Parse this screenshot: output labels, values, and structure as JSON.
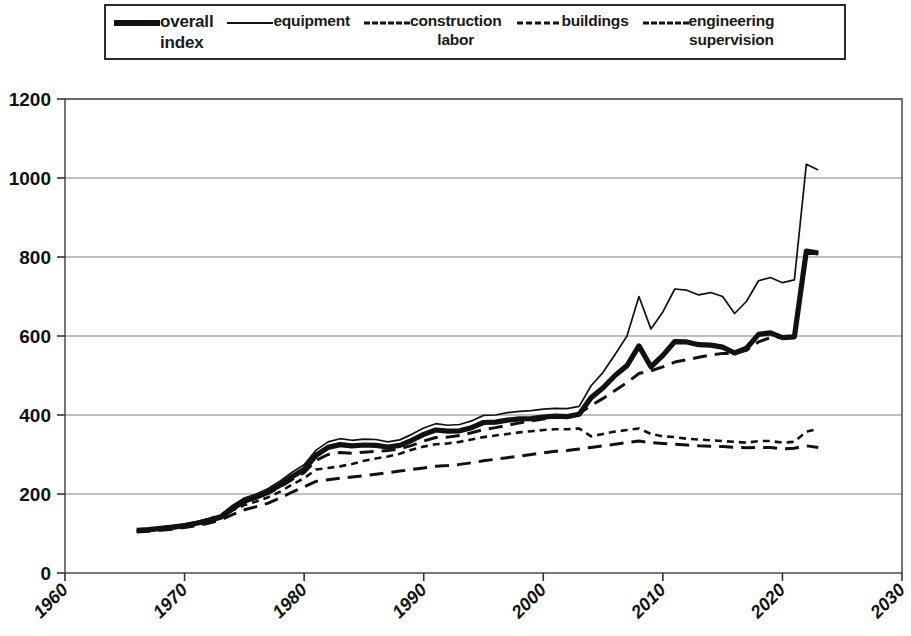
{
  "legend": {
    "entries": [
      {
        "label": "overall\nindex",
        "style": "thick-solid",
        "icon": "line-thick-icon"
      },
      {
        "label": "equipment",
        "style": "thin-solid",
        "icon": "line-thin-icon"
      },
      {
        "label": "construction\nlabor",
        "style": "long-dash",
        "icon": "line-longdash-icon"
      },
      {
        "label": "buildings",
        "style": "short-dash",
        "icon": "line-shortdash-icon"
      },
      {
        "label": "engineering\nsupervision",
        "style": "long-dash",
        "icon": "line-longdash2-icon"
      }
    ]
  },
  "axes": {
    "y_ticks": [
      "0",
      "200",
      "400",
      "600",
      "800",
      "1000",
      "1200"
    ],
    "x_ticks": [
      "1960",
      "1970",
      "1980",
      "1990",
      "2000",
      "2010",
      "2020",
      "2030"
    ]
  },
  "colors": {
    "line": "#111111",
    "grid": "#808080",
    "frame": "#555555",
    "background": "#ffffff"
  },
  "chart_data": {
    "type": "line",
    "title": "",
    "xlabel": "",
    "ylabel": "",
    "xlim": [
      1960,
      2030
    ],
    "ylim": [
      0,
      1200
    ],
    "ytick_step": 200,
    "xtick_step": 10,
    "grid": true,
    "legend_position": "top",
    "series": [
      {
        "name": "overall index",
        "style": "thick-solid",
        "x": [
          1966,
          1967,
          1968,
          1969,
          1970,
          1971,
          1972,
          1973,
          1974,
          1975,
          1976,
          1977,
          1978,
          1979,
          1980,
          1981,
          1982,
          1983,
          1984,
          1985,
          1986,
          1987,
          1988,
          1989,
          1990,
          1991,
          1992,
          1993,
          1994,
          1995,
          1996,
          1997,
          1998,
          1999,
          2000,
          2001,
          2002,
          2003,
          2004,
          2005,
          2006,
          2007,
          2008,
          2009,
          2010,
          2011,
          2012,
          2013,
          2014,
          2015,
          2016,
          2017,
          2018,
          2019,
          2020,
          2021,
          2022,
          2023
        ],
        "values": [
          108,
          110,
          113,
          116,
          120,
          126,
          132,
          141,
          163,
          182,
          192,
          205,
          223,
          244,
          262,
          298,
          318,
          325,
          322,
          324,
          323,
          319,
          323,
          336,
          351,
          362,
          359,
          360,
          368,
          381,
          382,
          387,
          390,
          391,
          395,
          397,
          396,
          402,
          444,
          469,
          500,
          525,
          575,
          522,
          551,
          586,
          585,
          578,
          577,
          572,
          557,
          569,
          604,
          608,
          596,
          598,
          815,
          810
        ]
      },
      {
        "name": "equipment",
        "style": "thin-solid",
        "x": [
          1966,
          1967,
          1968,
          1969,
          1970,
          1971,
          1972,
          1973,
          1974,
          1975,
          1976,
          1977,
          1978,
          1979,
          1980,
          1981,
          1982,
          1983,
          1984,
          1985,
          1986,
          1987,
          1988,
          1989,
          1990,
          1991,
          1992,
          1993,
          1994,
          1995,
          1996,
          1997,
          1998,
          1999,
          2000,
          2001,
          2002,
          2003,
          2004,
          2005,
          2006,
          2007,
          2008,
          2009,
          2010,
          2011,
          2012,
          2013,
          2014,
          2015,
          2016,
          2017,
          2018,
          2019,
          2020,
          2021,
          2022,
          2023
        ],
        "values": [
          110,
          112,
          116,
          120,
          124,
          130,
          137,
          147,
          171,
          190,
          200,
          214,
          233,
          255,
          274,
          311,
          332,
          340,
          336,
          339,
          338,
          332,
          337,
          351,
          367,
          378,
          374,
          376,
          385,
          399,
          400,
          406,
          409,
          411,
          415,
          417,
          416,
          422,
          474,
          508,
          553,
          600,
          700,
          618,
          661,
          719,
          716,
          704,
          710,
          700,
          657,
          688,
          740,
          748,
          735,
          742,
          1035,
          1020
        ]
      },
      {
        "name": "construction labor",
        "style": "long-dash",
        "x": [
          1966,
          1967,
          1968,
          1969,
          1970,
          1971,
          1972,
          1973,
          1974,
          1975,
          1976,
          1977,
          1978,
          1979,
          1980,
          1981,
          1982,
          1983,
          1984,
          1985,
          1986,
          1987,
          1988,
          1989,
          1990,
          1991,
          1992,
          1993,
          1994,
          1995,
          1996,
          1997,
          1998,
          1999,
          2000,
          2001,
          2002,
          2003,
          2004,
          2005,
          2006,
          2007,
          2008,
          2009,
          2010,
          2011,
          2012,
          2013,
          2014,
          2015,
          2016,
          2017,
          2018,
          2019,
          2020,
          2021,
          2022,
          2023
        ],
        "values": [
          106,
          109,
          112,
          116,
          121,
          128,
          136,
          146,
          164,
          180,
          190,
          202,
          218,
          237,
          254,
          285,
          300,
          305,
          303,
          306,
          308,
          310,
          314,
          323,
          334,
          343,
          344,
          348,
          355,
          363,
          368,
          374,
          380,
          385,
          390,
          395,
          398,
          404,
          424,
          442,
          462,
          482,
          505,
          512,
          522,
          534,
          540,
          546,
          552,
          556,
          556,
          564,
          585,
          596,
          598,
          600,
          812,
          808
        ]
      },
      {
        "name": "buildings",
        "style": "short-dash",
        "x": [
          1966,
          1967,
          1968,
          1969,
          1970,
          1971,
          1972,
          1973,
          1974,
          1975,
          1976,
          1977,
          1978,
          1979,
          1980,
          1981,
          1982,
          1983,
          1984,
          1985,
          1986,
          1987,
          1988,
          1989,
          1990,
          1991,
          1992,
          1993,
          1994,
          1995,
          1996,
          1997,
          1998,
          1999,
          2000,
          2001,
          2002,
          2003,
          2004,
          2005,
          2006,
          2007,
          2008,
          2009,
          2010,
          2011,
          2012,
          2013,
          2014,
          2015,
          2016,
          2017,
          2018,
          2019,
          2020,
          2021,
          2022,
          2023
        ],
        "values": [
          105,
          107,
          110,
          113,
          118,
          124,
          132,
          142,
          158,
          172,
          181,
          192,
          206,
          224,
          240,
          262,
          266,
          270,
          276,
          284,
          290,
          295,
          302,
          312,
          320,
          326,
          328,
          332,
          338,
          344,
          348,
          352,
          356,
          359,
          362,
          364,
          364,
          366,
          346,
          352,
          358,
          362,
          366,
          352,
          346,
          344,
          340,
          338,
          336,
          334,
          332,
          330,
          334,
          334,
          330,
          332,
          358,
          365
        ]
      },
      {
        "name": "engineering supervision",
        "style": "long-dash",
        "x": [
          1966,
          1967,
          1968,
          1969,
          1970,
          1971,
          1972,
          1973,
          1974,
          1975,
          1976,
          1977,
          1978,
          1979,
          1980,
          1981,
          1982,
          1983,
          1984,
          1985,
          1986,
          1987,
          1988,
          1989,
          1990,
          1991,
          1992,
          1993,
          1994,
          1995,
          1996,
          1997,
          1998,
          1999,
          2000,
          2001,
          2002,
          2003,
          2004,
          2005,
          2006,
          2007,
          2008,
          2009,
          2010,
          2011,
          2012,
          2013,
          2014,
          2015,
          2016,
          2017,
          2018,
          2019,
          2020,
          2021,
          2022,
          2023
        ],
        "values": [
          104,
          106,
          108,
          111,
          115,
          120,
          126,
          134,
          148,
          160,
          168,
          177,
          190,
          205,
          218,
          232,
          236,
          240,
          243,
          246,
          250,
          254,
          258,
          262,
          266,
          270,
          272,
          275,
          279,
          284,
          288,
          292,
          296,
          300,
          304,
          308,
          310,
          314,
          318,
          322,
          326,
          330,
          334,
          330,
          328,
          326,
          324,
          322,
          321,
          320,
          318,
          317,
          318,
          318,
          314,
          316,
          322,
          318
        ]
      }
    ]
  }
}
